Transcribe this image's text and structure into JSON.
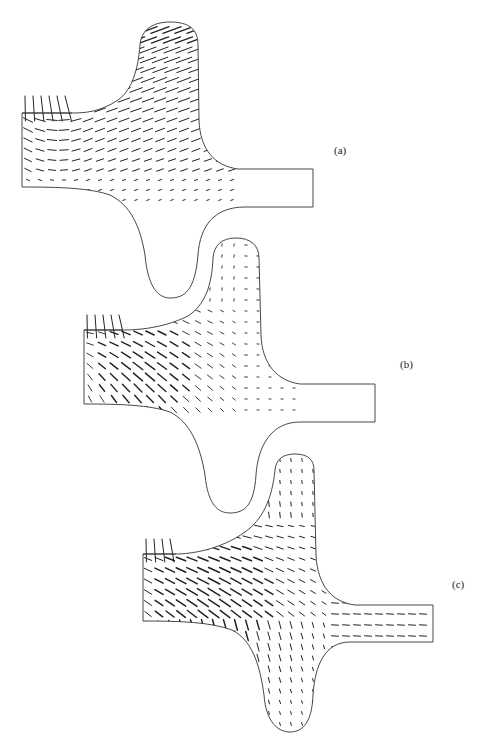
{
  "figure": {
    "panels": [
      {
        "id": "a",
        "label": "(a)",
        "label_pos": [
          334,
          144
        ],
        "outline": "M22,113 L22,187 C60,187 90,188 110,195 C130,205 140,225 145,255 C148,290 160,298 170,298 C185,298 195,290 198,255 C200,225 215,207 245,207 L313,207 L313,169 L238,169 C215,166 200,150 199,120 L198,45 C198,30 190,22 170,22 C150,22 141,32 140,45 C138,70 132,90 118,100 C100,112 85,113 72,113 Z",
        "inlet_line": [
          [
            22,
            113
          ],
          [
            72,
            113
          ]
        ],
        "inlet_verticals_top": 96,
        "field": {
          "x0": 28,
          "y0": 30,
          "x1": 235,
          "y1": 205,
          "dx": 12,
          "dy": 10,
          "mode": "a"
        }
      },
      {
        "id": "b",
        "label": "(b)",
        "label_pos": [
          400,
          358
        ],
        "outline": "M84,330 L84,404 C120,404 150,405 170,412 C190,422 200,445 205,475 C208,505 218,513 230,513 C245,513 254,505 256,475 C258,445 272,422 300,422 L375,422 L375,384 L300,384 C278,381 262,365 261,335 L259,258 C259,245 250,238 236,238 C222,238 214,245 213,258 C212,285 205,305 188,316 C160,330 130,330 122,330 Z",
        "inlet_line": [
          [
            84,
            330
          ],
          [
            122,
            330
          ]
        ],
        "inlet_verticals_top": 315,
        "field": {
          "x0": 90,
          "y0": 245,
          "x1": 300,
          "y1": 420,
          "dx": 12,
          "dy": 11,
          "mode": "b"
        }
      },
      {
        "id": "c",
        "label": "(c)",
        "label_pos": [
          452,
          578
        ],
        "outline": "M143,554 L143,621 C180,621 210,622 232,630 C252,640 260,665 264,695 C266,722 278,732 290,732 C303,732 312,722 313,695 C315,665 325,642 350,642 L433,642 L433,605 L355,605 C332,602 318,586 316,556 L314,470 C314,460 308,454 295,454 C282,454 276,460 275,470 C272,500 262,520 245,532 C220,550 190,554 176,554 Z",
        "inlet_line": [
          [
            143,
            554
          ],
          [
            176,
            554
          ]
        ],
        "inlet_verticals_top": 539,
        "field": {
          "x0": 148,
          "y0": 460,
          "x1": 430,
          "y1": 730,
          "dx": 11,
          "dy": 11,
          "mode": "c"
        }
      }
    ]
  }
}
